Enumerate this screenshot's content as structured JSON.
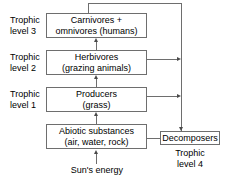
{
  "diagram": {
    "colors": {
      "box_border": "#6e6e6e",
      "line": "#6e6e6e",
      "arrow": "#4a4a4a",
      "text": "#000000",
      "background": "#ffffff"
    },
    "boxes": [
      {
        "id": "carnivores",
        "line1": "Carnivores +",
        "line2": "omnivores (humans)"
      },
      {
        "id": "herbivores",
        "line1": "Herbivores",
        "line2": "(grazing animals)"
      },
      {
        "id": "producers",
        "line1": "Producers",
        "line2": "(grass)"
      },
      {
        "id": "abiotic",
        "line1": "Abiotic substances",
        "line2": "(air, water, rock)"
      },
      {
        "id": "decomposers",
        "line1": "Decomposers",
        "line2": ""
      }
    ],
    "labels": {
      "trophic_level_3": {
        "line1": "Trophic",
        "line2": "level 3"
      },
      "trophic_level_2": {
        "line1": "Trophic",
        "line2": "level 2"
      },
      "trophic_level_1": {
        "line1": "Trophic",
        "line2": "level 1"
      },
      "trophic_level_4": {
        "line1": "Trophic",
        "line2": "level 4"
      },
      "suns_energy": "Sun's energy"
    },
    "connectors": [
      {
        "id": "sun-to-abiotic",
        "from": "Sun's energy",
        "to": "Abiotic substances",
        "direction": "up"
      },
      {
        "id": "abiotic-to-producers",
        "from": "Abiotic substances",
        "to": "Producers",
        "direction": "up"
      },
      {
        "id": "producers-to-herbivores",
        "from": "Producers",
        "to": "Herbivores",
        "direction": "up"
      },
      {
        "id": "herbivores-to-carnivores",
        "from": "Herbivores",
        "to": "Carnivores + omnivores (humans)",
        "direction": "up"
      },
      {
        "id": "carnivores-to-decomposers",
        "from": "Carnivores + omnivores (humans)",
        "to": "Decomposers",
        "direction": "down"
      },
      {
        "id": "herbivores-to-decomposers",
        "from": "Herbivores",
        "to": "Decomposers",
        "direction": "right"
      },
      {
        "id": "producers-to-decomposers",
        "from": "Producers",
        "to": "Decomposers",
        "direction": "right"
      },
      {
        "id": "decomposers-to-abiotic",
        "from": "Decomposers",
        "to": "Abiotic substances",
        "direction": "left"
      }
    ]
  }
}
